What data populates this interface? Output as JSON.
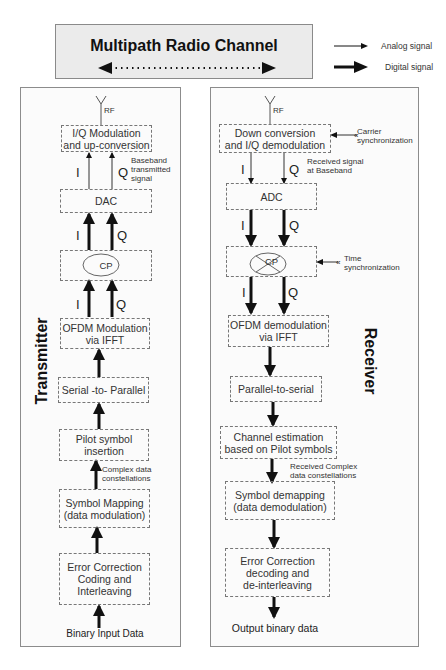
{
  "channel": {
    "title": "Multipath Radio Channel",
    "arrow": "bidirectional-dotted"
  },
  "legend": {
    "analog": "Analog signal",
    "digital": "Digital signal"
  },
  "transmitter": {
    "label": "Transmitter",
    "antenna_label": "RF",
    "blocks": [
      "I/Q Modulation\nand up-conversion",
      "DAC",
      "CP",
      "OFDM Modulation\nvia IFFT",
      "Serial -to- Parallel",
      "Pilot symbol\ninsertion",
      "Symbol Mapping\n(data modulation)",
      "Error Correction\nCoding and\nInterleaving"
    ],
    "notes": {
      "baseband": "Baseband\ntransmitted\nsignal",
      "constellations": "Complex data\nconstellations"
    },
    "iq": {
      "i": "I",
      "q": "Q"
    },
    "input": "Binary Input Data"
  },
  "receiver": {
    "label": "Receiver",
    "antenna_label": "RF",
    "blocks": [
      "Down conversion\nand I/Q demodulation",
      "ADC",
      "CP",
      "OFDM demodulation\nvia IFFT",
      "Parallel-to-serial",
      "Channel estimation\nbased on Pilot symbols",
      "Symbol demapping\n(data demodulation)",
      "Error Correction\ndecoding and\nde-interleaving"
    ],
    "notes": {
      "carrier_sync": "Carrier\nsynchronization",
      "received_baseband": "Received signal\nat Baseband",
      "time_sync": "Time\nsynchronization",
      "received_constellations": "Received Complex\ndata constellations"
    },
    "iq": {
      "i": "I",
      "q": "Q"
    },
    "output": "Output binary data"
  }
}
